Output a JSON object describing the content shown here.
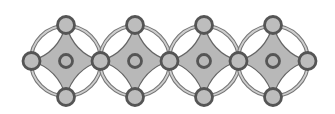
{
  "diagram": {
    "units_count": 4,
    "layout": {
      "unit_centers_x": [
        66,
        135,
        204,
        273
      ],
      "center_y": 61,
      "half_width": 34.5,
      "half_height": 36
    },
    "atoms": {
      "corner_radius": 8.5,
      "center_radius": 6.5
    },
    "colors": {
      "background": "#ffffff",
      "fill": "#b8b8b8",
      "atom_fill": "#bdbdbd",
      "atom_stroke": "#555555",
      "ring_light": "#cfcfcf",
      "ring_dark": "#777777",
      "edge_stroke": "#666666"
    }
  }
}
